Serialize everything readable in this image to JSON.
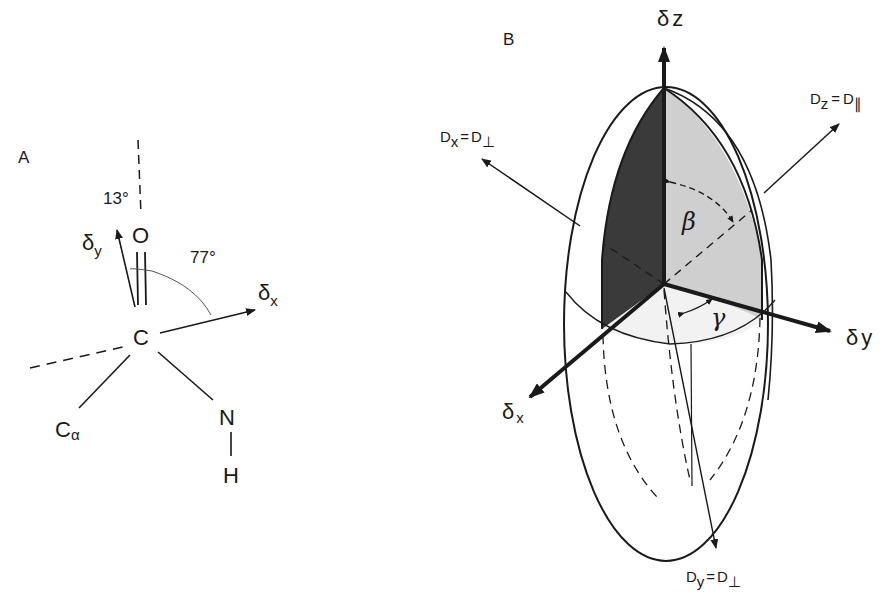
{
  "figure": {
    "panel_a": {
      "label": "A",
      "atoms": {
        "carbonyl_c": "C",
        "oxygen": "O",
        "nitrogen": "N",
        "hydrogen": "H",
        "c_alpha": "C",
        "c_alpha_sub": "α"
      },
      "axes": {
        "delta_y": "δ",
        "delta_y_sub": "y",
        "delta_x": "δ",
        "delta_x_sub": "x"
      },
      "angles": {
        "small": "13°",
        "large": "77°"
      }
    },
    "panel_b": {
      "label": "B",
      "axes": {
        "delta_z": "δ",
        "delta_z_sub": "z",
        "delta_y": "δ",
        "delta_y_sub": "y",
        "delta_x": "δ",
        "delta_x_sub": "x"
      },
      "diffusion": {
        "dx": {
          "d": "D",
          "sub": "x",
          "eq": "=",
          "rhs": "D",
          "rhs_sub": "⊥"
        },
        "dy": {
          "d": "D",
          "sub": "y",
          "eq": "=",
          "rhs": "D",
          "rhs_sub": "⊥"
        },
        "dz": {
          "d": "D",
          "sub": "z",
          "eq": "=",
          "rhs": "D",
          "rhs_sub": "∥"
        }
      },
      "angles": {
        "beta": "β",
        "gamma": "γ"
      },
      "colors": {
        "dark_face": "#3a3a3a",
        "light_face": "#cfcfcf",
        "cap": "#f2f2f2"
      }
    }
  }
}
